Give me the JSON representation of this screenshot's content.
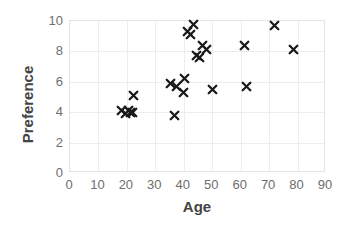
{
  "chart_data": {
    "type": "scatter",
    "title": "",
    "xlabel": "Age",
    "ylabel": "Preference",
    "xlim": [
      0,
      90
    ],
    "ylim": [
      0,
      10
    ],
    "xticks": [
      0,
      10,
      20,
      30,
      40,
      50,
      60,
      70,
      80,
      90
    ],
    "yticks": [
      0,
      2,
      4,
      6,
      8,
      10
    ],
    "grid": true,
    "legend": null,
    "marker": "x",
    "marker_color": "#1a1a1a",
    "series": [
      {
        "name": "Age vs Preference",
        "points": [
          [
            18.0,
            4.1
          ],
          [
            19.6,
            3.9
          ],
          [
            20.6,
            4.1
          ],
          [
            21.4,
            4.0
          ],
          [
            22.0,
            4.0
          ],
          [
            22.3,
            5.1
          ],
          [
            35.2,
            5.9
          ],
          [
            36.8,
            3.8
          ],
          [
            37.4,
            5.7
          ],
          [
            39.9,
            5.3
          ],
          [
            40.3,
            6.2
          ],
          [
            41.3,
            9.3
          ],
          [
            42.2,
            9.1
          ],
          [
            43.3,
            9.8
          ],
          [
            44.5,
            7.7
          ],
          [
            45.6,
            7.6
          ],
          [
            46.5,
            8.4
          ],
          [
            48.0,
            8.1
          ],
          [
            50.0,
            5.5
          ],
          [
            61.3,
            8.4
          ],
          [
            62.0,
            5.7
          ],
          [
            72.0,
            9.7
          ],
          [
            78.6,
            8.1
          ]
        ]
      }
    ]
  }
}
